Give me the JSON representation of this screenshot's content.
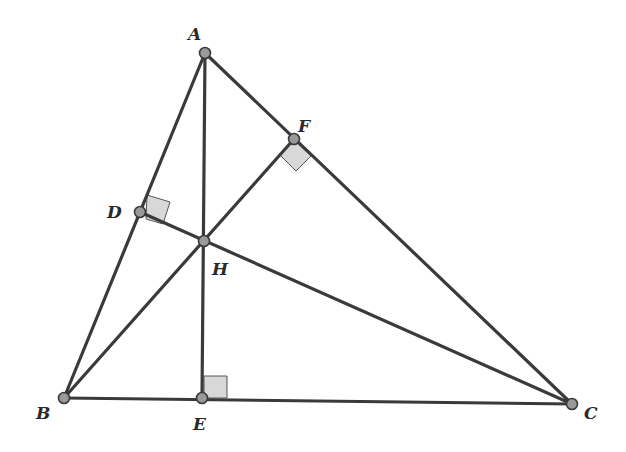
{
  "diagram": {
    "points": {
      "A": {
        "label": "A",
        "x": 205,
        "y": 53,
        "lx": 188,
        "ly": 40
      },
      "B": {
        "label": "B",
        "x": 64,
        "y": 398,
        "lx": 36,
        "ly": 419
      },
      "C": {
        "label": "C",
        "x": 572,
        "y": 404,
        "lx": 584,
        "ly": 419
      },
      "D": {
        "label": "D",
        "x": 140,
        "y": 212,
        "lx": 107,
        "ly": 218
      },
      "E": {
        "label": "E",
        "x": 202,
        "y": 398,
        "lx": 193,
        "ly": 430
      },
      "F": {
        "label": "F",
        "x": 294,
        "y": 139,
        "lx": 298,
        "ly": 132
      },
      "H": {
        "label": "H",
        "x": 204,
        "y": 241,
        "lx": 212,
        "ly": 275
      }
    },
    "segments": [
      "AB",
      "BC",
      "CA",
      "AE",
      "BF",
      "CD"
    ],
    "right_angles": [
      "D",
      "E",
      "F"
    ],
    "colors": {
      "line": "#3a3a3a",
      "point_fill": "#9a9a9a",
      "right_angle_fill": "#d8d8d8"
    }
  }
}
